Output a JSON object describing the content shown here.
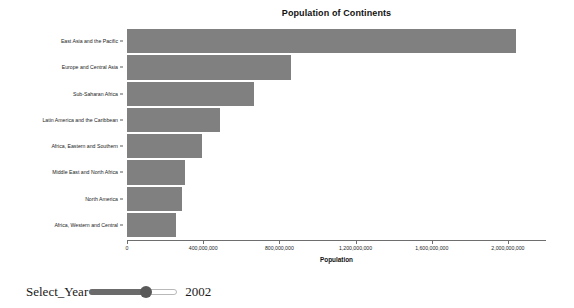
{
  "chart_data": {
    "type": "bar",
    "orientation": "horizontal",
    "title": "Population of Continents",
    "xlabel": "Population",
    "ylabel": "",
    "xlim": [
      0,
      2200000000
    ],
    "xticks": [
      0,
      400000000,
      800000000,
      1200000000,
      1600000000,
      2000000000
    ],
    "xtick_labels": [
      "0",
      "400,000,000",
      "800,000,000",
      "1,200,000,000",
      "1,600,000,000",
      "2,000,000,000"
    ],
    "grid": false,
    "legend": null,
    "bar_color": "#808080",
    "categories": [
      "East Asia and the Pacific",
      "Europe and Central Asia",
      "Sub-Saharan Africa",
      "Latin America and the Caribbean",
      "Africa, Eastern and Southern",
      "Middle East and North Africa",
      "North America",
      "Africa, Western and Central"
    ],
    "values": [
      2040000000,
      860000000,
      665000000,
      490000000,
      395000000,
      305000000,
      290000000,
      255000000
    ]
  },
  "controls": {
    "year_slider": {
      "label": "Select_Year",
      "value": "2002",
      "fill_percent": 65
    }
  }
}
